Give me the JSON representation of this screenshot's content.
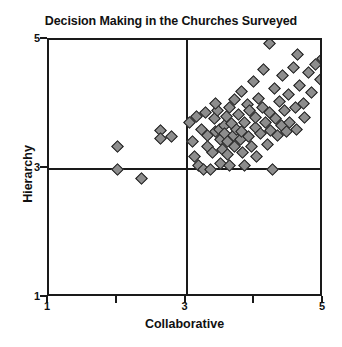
{
  "chart_data": {
    "type": "scatter",
    "title": "Decision Making in the Churches Surveyed",
    "xlabel": "Collaborative",
    "ylabel": "Hierarchy",
    "xlim": [
      1,
      5
    ],
    "ylim": [
      1,
      5
    ],
    "xticks": [
      1,
      3,
      5
    ],
    "xminorticks": [
      2,
      4
    ],
    "yticks": [
      1,
      3,
      5
    ],
    "grid": false,
    "legend": null,
    "reference_lines": {
      "x": 3,
      "y": 3
    },
    "marker": "diamond",
    "marker_fill": "#8d8d8d",
    "marker_edge": "#1c1c1c",
    "points": [
      [
        2.0,
        3.35
      ],
      [
        2.0,
        3.0
      ],
      [
        2.35,
        2.85
      ],
      [
        2.62,
        3.6
      ],
      [
        2.62,
        3.47
      ],
      [
        2.78,
        3.5
      ],
      [
        3.05,
        3.72
      ],
      [
        3.08,
        3.43
      ],
      [
        3.12,
        3.2
      ],
      [
        3.18,
        3.05
      ],
      [
        3.22,
        3.62
      ],
      [
        3.25,
        3.0
      ],
      [
        3.3,
        3.35
      ],
      [
        3.3,
        3.52
      ],
      [
        3.35,
        3.0
      ],
      [
        3.38,
        3.25
      ],
      [
        3.4,
        3.78
      ],
      [
        3.42,
        3.58
      ],
      [
        3.45,
        3.9
      ],
      [
        3.48,
        3.62
      ],
      [
        3.5,
        3.08
      ],
      [
        3.5,
        3.45
      ],
      [
        3.52,
        3.3
      ],
      [
        3.55,
        3.68
      ],
      [
        3.55,
        3.55
      ],
      [
        3.58,
        3.82
      ],
      [
        3.6,
        3.42
      ],
      [
        3.6,
        3.22
      ],
      [
        3.62,
        3.95
      ],
      [
        3.65,
        3.7
      ],
      [
        3.68,
        3.52
      ],
      [
        3.7,
        3.35
      ],
      [
        3.7,
        4.08
      ],
      [
        3.72,
        3.62
      ],
      [
        3.75,
        3.85
      ],
      [
        3.78,
        3.45
      ],
      [
        3.8,
        4.2
      ],
      [
        3.8,
        3.58
      ],
      [
        3.82,
        3.25
      ],
      [
        3.85,
        3.72
      ],
      [
        3.88,
        4.0
      ],
      [
        3.9,
        3.5
      ],
      [
        3.92,
        3.9
      ],
      [
        3.95,
        3.35
      ],
      [
        3.98,
        4.35
      ],
      [
        4.0,
        3.65
      ],
      [
        4.0,
        3.8
      ],
      [
        4.02,
        3.2
      ],
      [
        4.05,
        4.1
      ],
      [
        4.08,
        3.55
      ],
      [
        4.1,
        3.95
      ],
      [
        4.12,
        4.55
      ],
      [
        4.15,
        3.72
      ],
      [
        4.18,
        3.38
      ],
      [
        4.2,
        4.95
      ],
      [
        4.2,
        3.88
      ],
      [
        4.22,
        3.6
      ],
      [
        4.25,
        3.0
      ],
      [
        4.28,
        4.25
      ],
      [
        4.3,
        3.78
      ],
      [
        4.32,
        3.52
      ],
      [
        4.35,
        4.05
      ],
      [
        4.38,
        3.68
      ],
      [
        4.4,
        4.45
      ],
      [
        4.42,
        3.9
      ],
      [
        4.45,
        3.58
      ],
      [
        4.48,
        4.15
      ],
      [
        4.5,
        3.72
      ],
      [
        4.55,
        4.58
      ],
      [
        4.58,
        3.95
      ],
      [
        4.6,
        3.62
      ],
      [
        4.65,
        4.3
      ],
      [
        4.7,
        4.02
      ],
      [
        4.72,
        3.8
      ],
      [
        4.78,
        4.5
      ],
      [
        4.82,
        4.18
      ],
      [
        4.88,
        4.62
      ],
      [
        4.95,
        4.38
      ],
      [
        4.98,
        4.72
      ],
      [
        3.15,
        3.82
      ],
      [
        3.28,
        3.88
      ],
      [
        3.42,
        4.02
      ],
      [
        3.62,
        3.05
      ],
      [
        3.85,
        3.05
      ],
      [
        4.62,
        4.78
      ]
    ]
  },
  "axes": {
    "x_tick_labels": [
      "1",
      "3",
      "5"
    ],
    "y_tick_labels": [
      "5",
      "3",
      "1"
    ]
  }
}
